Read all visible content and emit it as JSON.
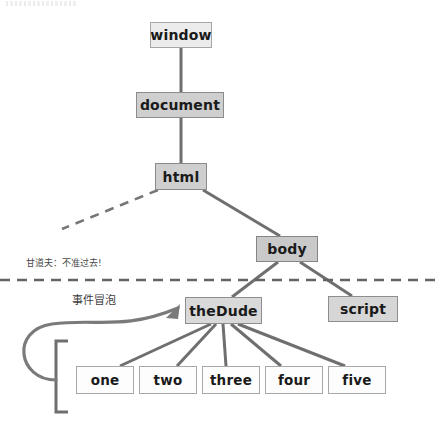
{
  "diagram": {
    "nodes": [
      {
        "id": "window",
        "label": "window",
        "x": 150,
        "y": 22,
        "w": 62,
        "h": 26,
        "style": "lvl-window"
      },
      {
        "id": "document",
        "label": "document",
        "x": 136,
        "y": 92,
        "w": 88,
        "h": 26,
        "style": "lvl-document"
      },
      {
        "id": "html",
        "label": "html",
        "x": 155,
        "y": 163,
        "w": 52,
        "h": 27,
        "style": "lvl-html"
      },
      {
        "id": "body",
        "label": "body",
        "x": 256,
        "y": 236,
        "w": 62,
        "h": 26,
        "style": "lvl-body"
      },
      {
        "id": "script",
        "label": "script",
        "x": 328,
        "y": 296,
        "w": 70,
        "h": 26,
        "style": "lvl-script"
      },
      {
        "id": "theDude",
        "label": "theDude",
        "x": 185,
        "y": 297,
        "w": 77,
        "h": 27,
        "style": "lvl-thedude"
      },
      {
        "id": "one",
        "label": "one",
        "x": 76,
        "y": 366,
        "w": 58,
        "h": 28,
        "style": "leaf"
      },
      {
        "id": "two",
        "label": "two",
        "x": 139,
        "y": 366,
        "w": 58,
        "h": 28,
        "style": "leaf"
      },
      {
        "id": "three",
        "label": "three",
        "x": 202,
        "y": 366,
        "w": 58,
        "h": 28,
        "style": "leaf"
      },
      {
        "id": "four",
        "label": "four",
        "x": 265,
        "y": 366,
        "w": 58,
        "h": 28,
        "style": "leaf"
      },
      {
        "id": "five",
        "label": "five",
        "x": 328,
        "y": 366,
        "w": 58,
        "h": 28,
        "style": "leaf"
      }
    ],
    "annotations": [
      {
        "id": "no-pass",
        "text": "甘道夫：不准过去!",
        "x": 26,
        "y": 256
      },
      {
        "id": "bubbling",
        "text": "事件冒泡",
        "x": 72,
        "y": 291
      }
    ],
    "colors": {
      "edge": "#6f6f6f",
      "dashed_barrier": "#636363",
      "arrow": "#7a7a7a",
      "bracket": "#6f6f6f",
      "node_text": "#1a1a1a"
    },
    "legend": {
      "barrier_note": "horizontal dashed line separating document-level nodes from body children",
      "dashed_branch_note": "dashed diagonal branch from html to an omitted sibling"
    }
  }
}
